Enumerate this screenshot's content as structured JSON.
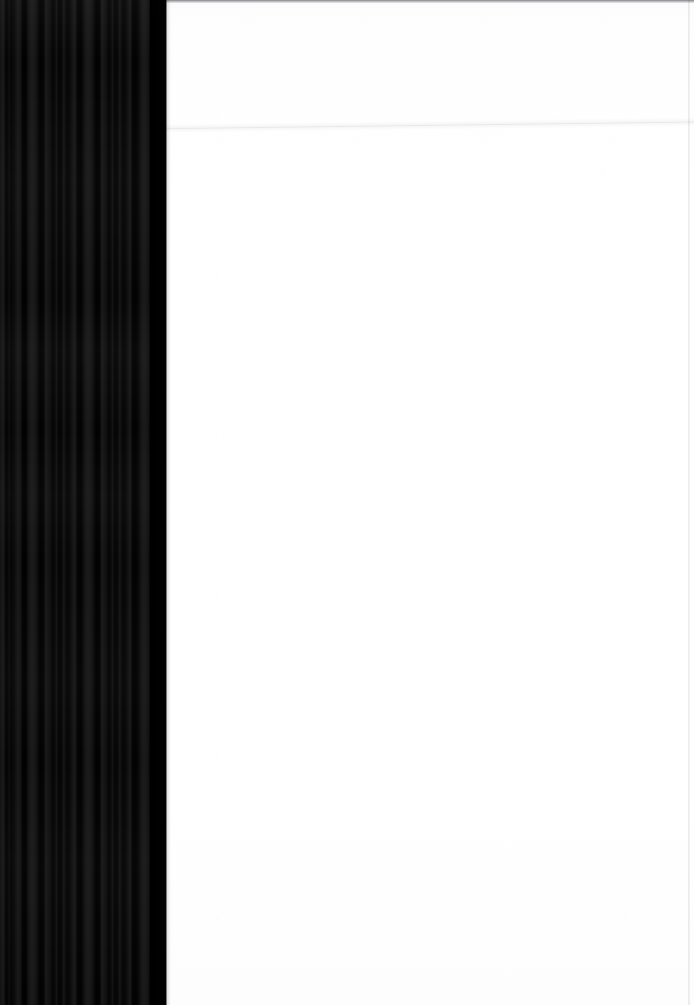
{
  "document": {
    "kind": "scanned-page",
    "description": "Scanned book page: blank white leaf with dark binding-gutter shadow along the left edge",
    "width": 694,
    "height": 1005,
    "visible_text": "",
    "page_number": ""
  },
  "regions": {
    "gutter": {
      "name": "binding-gutter-shadow",
      "x": 0,
      "y": 0,
      "width": 166,
      "height": 1005,
      "color": "#0d0d0d",
      "stripe_colors": [
        "#040404",
        "#0a0a0a",
        "#121212",
        "#1b1b1b"
      ],
      "pattern": "vertical-stripes"
    },
    "paper": {
      "name": "blank-page-surface",
      "x": 166,
      "y": 0,
      "width": 528,
      "height": 1005,
      "color": "#fefefe",
      "content": ""
    }
  },
  "artifacts": {
    "top_edge_line": {
      "name": "page-top-edge",
      "y": 0,
      "height": 3,
      "color": "#8a8c90"
    },
    "scan_fold_line": {
      "name": "diagonal-scan-line",
      "y_left": 131,
      "y_right": 124,
      "angle_deg": -0.72,
      "color": "#d8d8d8"
    },
    "right_edge_line": {
      "name": "page-right-edge",
      "x": 688,
      "color": "#e2e2e2"
    }
  }
}
